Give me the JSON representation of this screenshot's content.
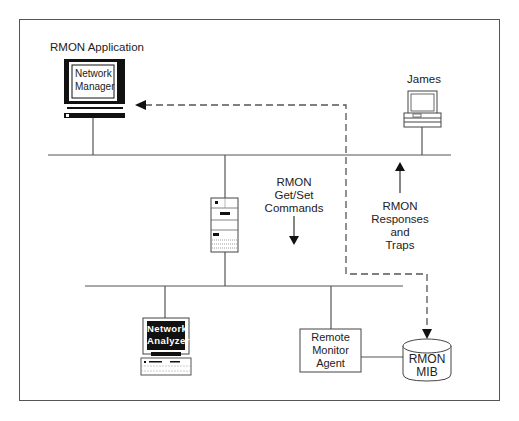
{
  "diagram": {
    "nodes": {
      "manager": {
        "caption": "RMON Application",
        "screen_line1": "Network",
        "screen_line2": "Manager"
      },
      "james": {
        "caption": "James"
      },
      "server": {
        "caption": ""
      },
      "analyzer": {
        "screen_line1": "Network",
        "screen_line2": "Analyzer"
      },
      "agent": {
        "line1": "Remote",
        "line2": "Monitor",
        "line3": "Agent"
      },
      "mib": {
        "line1": "RMON",
        "line2": "MIB"
      }
    },
    "labels": {
      "commands": {
        "line1": "RMON",
        "line2": "Get/Set",
        "line3": "Commands"
      },
      "responses": {
        "line1": "RMON",
        "line2": "Responses",
        "line3": "and",
        "line4": "Traps"
      }
    },
    "colors": {
      "line": "#555555",
      "ink": "#111111",
      "background": "#ffffff"
    }
  }
}
